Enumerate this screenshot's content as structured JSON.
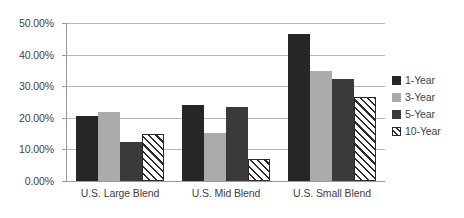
{
  "chart_data": {
    "type": "bar",
    "title": "",
    "subtitle": "",
    "xlabel": "",
    "ylabel": "",
    "categories": [
      "U.S. Large Blend",
      "U.S. Mid Blend",
      "U.S. Small Blend"
    ],
    "series": [
      {
        "name": "1-Year",
        "color": "#262626",
        "values": [
          20.6,
          23.9,
          46.5
        ]
      },
      {
        "name": "3-Year",
        "color": "#ababab",
        "values": [
          21.8,
          15.2,
          34.8
        ]
      },
      {
        "name": "5-Year",
        "color": "#3a3a3a",
        "values": [
          12.3,
          23.4,
          32.3
        ]
      },
      {
        "name": "10-Year",
        "color": "#ffffff",
        "pattern": "diagonal-hatch",
        "values": [
          14.9,
          7.0,
          26.6
        ]
      }
    ],
    "ylim": [
      0,
      50
    ],
    "ytick_values": [
      0,
      10,
      20,
      30,
      40,
      50
    ],
    "ytick_labels": [
      "0.00%",
      "10.00%",
      "20.00%",
      "30.00%",
      "40.00%",
      "50.00%"
    ],
    "value_format": "percent",
    "grid": true,
    "grid_axis": "y",
    "legend_position": "right",
    "legend_entries": [
      "1-Year",
      "3-Year",
      "5-Year",
      "10-Year"
    ]
  }
}
